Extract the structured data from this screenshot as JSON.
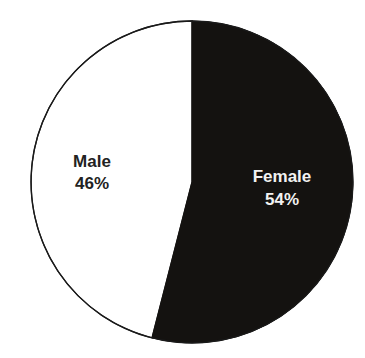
{
  "chart_data": {
    "type": "pie",
    "title": "",
    "categories": [
      "Female",
      "Male"
    ],
    "values": [
      54,
      46
    ],
    "labels": [
      {
        "name": "Female",
        "pct": "54%"
      },
      {
        "name": "Male",
        "pct": "46%"
      }
    ],
    "colors": {
      "Female": "#141210",
      "Male": "#ffffff"
    },
    "outline_color": "#1a1a1a",
    "legend": "none (labels inside slices)"
  }
}
